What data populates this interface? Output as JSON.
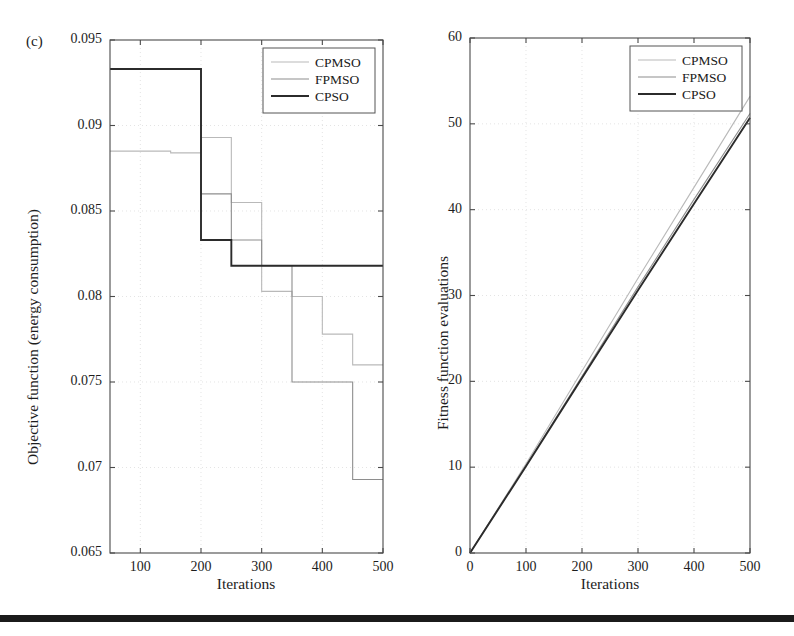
{
  "figure": {
    "panel_tag": "(c)",
    "footer_rule_color": "#1b1b1b"
  },
  "series_colors": {
    "CPMSO": "#b9b9b9",
    "FPMSO": "#8e8e8e",
    "CPSO": "#2b2b2b"
  },
  "legend": {
    "entries": [
      "CPMSO",
      "FPMSO",
      "CPSO"
    ]
  },
  "chart_data": [
    {
      "id": "left",
      "type": "line",
      "title": "",
      "xlabel": "Iterations",
      "ylabel": "Objective function (energy consumption)",
      "xlim": [
        50,
        500
      ],
      "ylim": [
        0.065,
        0.095
      ],
      "xticks": [
        100,
        200,
        300,
        400,
        500
      ],
      "xticklabels": [
        "100",
        "200",
        "300",
        "400",
        "500"
      ],
      "yticks": [
        0.065,
        0.07,
        0.075,
        0.08,
        0.085,
        0.09,
        0.095
      ],
      "yticklabels": [
        "0.065",
        "0.07",
        "0.075",
        "0.08",
        "0.085",
        "0.09",
        "0.095"
      ],
      "grid": true,
      "drawstyle": "steps-post",
      "legend_position": "top-right",
      "series": [
        {
          "name": "CPMSO",
          "x": [
            50,
            150,
            200,
            250,
            300,
            350,
            400,
            450,
            500
          ],
          "values": [
            0.0885,
            0.0884,
            0.0893,
            0.0855,
            0.0803,
            0.08,
            0.0778,
            0.076,
            0.076
          ]
        },
        {
          "name": "FPMSO",
          "x": [
            50,
            200,
            250,
            300,
            350,
            400,
            450,
            500
          ],
          "values": [
            0.0933,
            0.086,
            0.0833,
            0.0818,
            0.075,
            0.075,
            0.0693,
            0.0693
          ]
        },
        {
          "name": "CPSO",
          "x": [
            50,
            200,
            250,
            300,
            350,
            400,
            450,
            500
          ],
          "values": [
            0.0933,
            0.0833,
            0.0818,
            0.0818,
            0.0818,
            0.0818,
            0.0818,
            0.0818
          ]
        }
      ]
    },
    {
      "id": "right",
      "type": "line",
      "title": "",
      "xlabel": "Iterations",
      "ylabel": "Fitness function evaluations",
      "xlim": [
        0,
        500
      ],
      "ylim": [
        0,
        60
      ],
      "xticks": [
        0,
        100,
        200,
        300,
        400,
        500
      ],
      "xticklabels": [
        "0",
        "100",
        "200",
        "300",
        "400",
        "500"
      ],
      "yticks": [
        0,
        10,
        20,
        30,
        40,
        50,
        60
      ],
      "yticklabels": [
        "0",
        "10",
        "20",
        "30",
        "40",
        "50",
        "60"
      ],
      "grid": true,
      "drawstyle": "default",
      "legend_position": "top-right",
      "series": [
        {
          "name": "CPMSO",
          "x": [
            0,
            100,
            200,
            300,
            400,
            500
          ],
          "values": [
            0,
            10.4,
            21.2,
            32.0,
            42.6,
            53.2
          ]
        },
        {
          "name": "FPMSO",
          "x": [
            0,
            100,
            200,
            300,
            400,
            500
          ],
          "values": [
            0,
            10.2,
            20.6,
            31.0,
            41.2,
            51.2
          ]
        },
        {
          "name": "CPSO",
          "x": [
            0,
            100,
            200,
            300,
            400,
            500
          ],
          "values": [
            0,
            10.1,
            20.4,
            30.6,
            40.7,
            50.7
          ]
        }
      ]
    }
  ]
}
